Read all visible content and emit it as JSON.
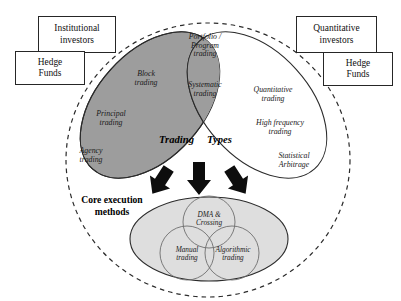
{
  "diagram": {
    "title_left": "Trading",
    "title_right": "Types",
    "core_label": "Core execution\nmethods",
    "colors": {
      "gray_fill": "#9d9d9d",
      "white_fill": "#ffffff",
      "light_fill": "#dedede",
      "stroke": "#2b2b2b",
      "arrow": "#0d0d0d"
    }
  },
  "boxes": [
    {
      "name": "institutional-investors",
      "label": "Institutional\ninvestors"
    },
    {
      "name": "hedge-funds-left",
      "label": "Hedge\nFunds"
    },
    {
      "name": "quantitative-investors",
      "label": "Quantitative\ninvestors"
    },
    {
      "name": "hedge-funds-right",
      "label": "Hedge\nFunds"
    }
  ],
  "left_ellipse_items": [
    {
      "name": "block-trading",
      "label": "Block\ntrading"
    },
    {
      "name": "principal-trading",
      "label": "Principal\ntrading"
    },
    {
      "name": "agency-trading",
      "label": "Agency\ntrading"
    }
  ],
  "intersection_items": [
    {
      "name": "portfolio-program-trading",
      "label": "Portfolio /\nProgram\ntrading"
    },
    {
      "name": "systematic-trading",
      "label": "Systematic\ntrading"
    }
  ],
  "right_ellipse_items": [
    {
      "name": "quantitative-trading",
      "label": "Quantitative\ntrading"
    },
    {
      "name": "high-frequency-trading",
      "label": "High frequency\ntrading"
    },
    {
      "name": "statistical-arbitrage",
      "label": "Statistical\nArbitrage"
    }
  ],
  "core_circles": [
    {
      "name": "dma-crossing",
      "label": "DMA &\nCrossing"
    },
    {
      "name": "manual-trading",
      "label": "Manual\ntrading"
    },
    {
      "name": "algorithmic-trading",
      "label": "Algorithmic\ntrading"
    }
  ]
}
